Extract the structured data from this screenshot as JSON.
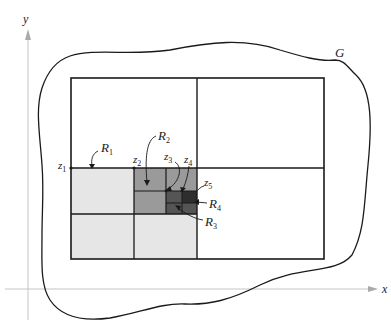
{
  "diagram": {
    "axes": {
      "x_label": "x",
      "y_label": "y",
      "color": "#bbbbbb"
    },
    "region_label": "G",
    "colors": {
      "outline": "#1a1a1a",
      "light_fill": "#e6e6e6",
      "mid_fill": "#9a9a9a",
      "dark_fill": "#555555",
      "darkest_fill": "#2e2e2e"
    },
    "rectangles": [
      {
        "name": "R1",
        "label": "R",
        "sub": "1"
      },
      {
        "name": "R2",
        "label": "R",
        "sub": "2"
      },
      {
        "name": "R3",
        "label": "R",
        "sub": "3"
      },
      {
        "name": "R4",
        "label": "R",
        "sub": "4"
      }
    ],
    "points": [
      {
        "name": "z1",
        "label": "z",
        "sub": "1"
      },
      {
        "name": "z2",
        "label": "z",
        "sub": "2"
      },
      {
        "name": "z3",
        "label": "z",
        "sub": "3"
      },
      {
        "name": "z4",
        "label": "z",
        "sub": "4"
      },
      {
        "name": "z5",
        "label": "z",
        "sub": "5"
      }
    ]
  }
}
